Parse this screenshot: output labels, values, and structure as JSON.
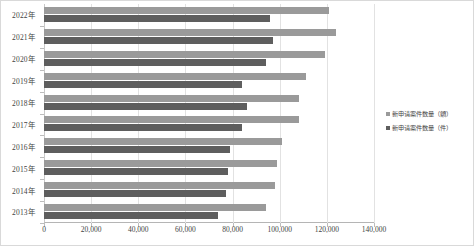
{
  "chart_data": {
    "type": "bar",
    "orientation": "horizontal",
    "title": "",
    "xlabel": "",
    "ylabel": "",
    "xlim": [
      0,
      140000
    ],
    "grid": true,
    "legend_position": "right",
    "xticks": [
      "0",
      "20,000",
      "40,000",
      "60,000",
      "80,000",
      "100,000",
      "120,000",
      "140,000"
    ],
    "xtick_values": [
      0,
      20000,
      40000,
      60000,
      80000,
      100000,
      120000,
      140000
    ],
    "categories": [
      "2022年",
      "2021年",
      "2020年",
      "2019年",
      "2018年",
      "2017年",
      "2016年",
      "2015年",
      "2014年",
      "2013年"
    ],
    "series": [
      {
        "name": "新申请案件数量（额）",
        "color": "#9a9a9a",
        "values": [
          121000,
          124000,
          119000,
          111000,
          108000,
          108000,
          101000,
          99000,
          98000,
          94000
        ]
      },
      {
        "name": "新申请案件数量（件）",
        "color": "#5e5e5e",
        "values": [
          96000,
          97000,
          94000,
          84000,
          86000,
          84000,
          79000,
          78000,
          77000,
          74000
        ]
      }
    ]
  },
  "legend": {
    "items": [
      {
        "label": "新申请案件数量（額）",
        "color": "#9a9a9a"
      },
      {
        "label": "新申请案件数量（件）",
        "color": "#5e5e5e"
      }
    ]
  },
  "colors": {
    "series_a": "#9a9a9a",
    "series_b": "#5e5e5e",
    "grid": "#e2e2e2",
    "axis": "#bdbdbd",
    "frame": "#d9d9d9",
    "text": "#3f3f3f",
    "background": "#ffffff"
  }
}
